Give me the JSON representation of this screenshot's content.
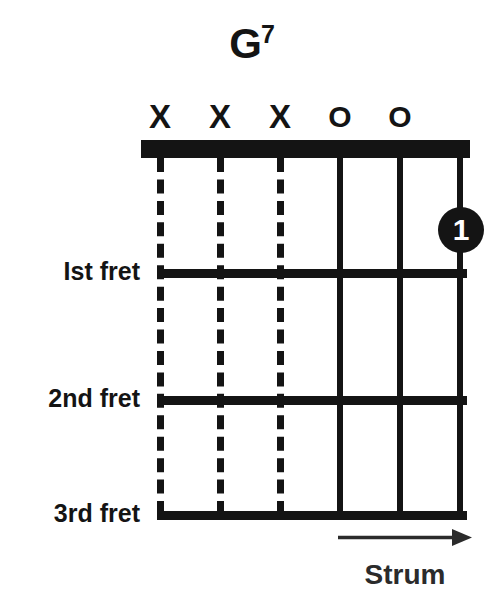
{
  "diagram": {
    "kind": "guitar-chord-diagram",
    "title": {
      "root": "G",
      "quality": "7",
      "full": "G7"
    },
    "instrument": "guitar",
    "string_count": 6,
    "fret_count": 3,
    "colors": {
      "ink": "#141414",
      "background": "#ffffff",
      "dot_text": "#ffffff",
      "arrow": "#2b2b2b"
    },
    "strings": [
      {
        "index": 1,
        "x": 160,
        "marker": "X",
        "marker_name": "muted",
        "line_style": "dashed"
      },
      {
        "index": 2,
        "x": 220,
        "marker": "X",
        "marker_name": "muted",
        "line_style": "dashed"
      },
      {
        "index": 3,
        "x": 280,
        "marker": "X",
        "marker_name": "muted",
        "line_style": "dashed"
      },
      {
        "index": 4,
        "x": 340,
        "marker": "O",
        "marker_name": "open",
        "line_style": "solid"
      },
      {
        "index": 5,
        "x": 400,
        "marker": "O",
        "marker_name": "open",
        "line_style": "solid"
      },
      {
        "index": 6,
        "x": 460,
        "marker": "",
        "marker_name": "fretted",
        "line_style": "solid"
      }
    ],
    "nut": {
      "x": 141,
      "y": 140,
      "width": 329,
      "height": 18
    },
    "frets": [
      {
        "number": 1,
        "label": "Ist fret",
        "y": 273,
        "thickness": 9
      },
      {
        "number": 2,
        "label": "2nd fret",
        "y": 400,
        "thickness": 9
      },
      {
        "number": 3,
        "label": "3rd fret",
        "y": 515,
        "thickness": 9
      }
    ],
    "fingerings": [
      {
        "finger": "1",
        "string": 6,
        "fret": 1,
        "x": 461,
        "y": 230
      }
    ],
    "strum": {
      "label": "Strum",
      "direction": "right",
      "arrow_name": "arrow-right",
      "x_start": 340,
      "x_end": 466,
      "y": 537
    }
  }
}
